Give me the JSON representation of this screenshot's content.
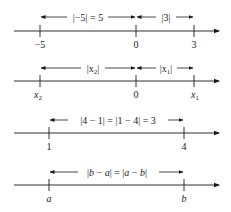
{
  "diagram": {
    "number_lines": [
      {
        "id": "line-1",
        "ticks": [
          {
            "label": "−5",
            "italic": false
          },
          {
            "label": "0",
            "italic": false
          },
          {
            "label": "3",
            "italic": false
          }
        ],
        "spans": [
          {
            "label": "|−5| = 5",
            "from": "−5",
            "to": "0"
          },
          {
            "label": "|3|",
            "from": "0",
            "to": "3"
          }
        ]
      },
      {
        "id": "line-2",
        "ticks": [
          {
            "label": "x",
            "sub": "2",
            "italic": true
          },
          {
            "label": "0",
            "italic": false
          },
          {
            "label": "x",
            "sub": "1",
            "italic": true
          }
        ],
        "spans": [
          {
            "label_pre": "|x",
            "label_sub": "2",
            "label_post": "|",
            "from": "x2",
            "to": "0"
          },
          {
            "label_pre": "|x",
            "label_sub": "1",
            "label_post": "|",
            "from": "0",
            "to": "x1"
          }
        ]
      },
      {
        "id": "line-3",
        "ticks": [
          {
            "label": "1",
            "italic": false
          },
          {
            "label": "4",
            "italic": false
          }
        ],
        "spans": [
          {
            "label": "|4 − 1| = |1 − 4| = 3",
            "from": "1",
            "to": "4"
          }
        ]
      },
      {
        "id": "line-4",
        "ticks": [
          {
            "label": "a",
            "italic": true
          },
          {
            "label": "b",
            "italic": true
          }
        ],
        "spans": [
          {
            "label_parts": [
              "|",
              "b",
              " − ",
              "a",
              "| = |",
              "a",
              " − ",
              "b",
              "|"
            ],
            "from": "a",
            "to": "b"
          }
        ]
      }
    ]
  }
}
